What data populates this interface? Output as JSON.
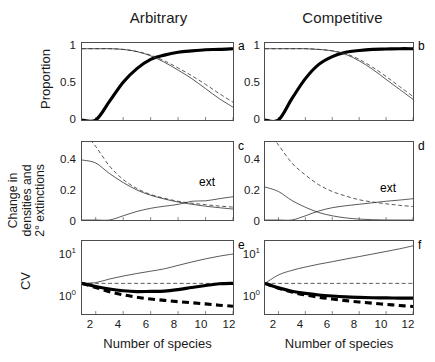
{
  "figure": {
    "column_titles": [
      "Arbitrary",
      "Competitive"
    ],
    "xlabel": "Number of species",
    "ylabels": {
      "row1": "Proportion",
      "row2_line1": "Change in",
      "row2_line2": "densities and",
      "row2_line3": "2° extinctions",
      "row3": "CV"
    },
    "xticks": [
      "2",
      "4",
      "6",
      "8",
      "10",
      "12"
    ],
    "yticks_row1": [
      "1",
      "0.5",
      "0"
    ],
    "yticks_row2": [
      "0.4",
      "0.2",
      "0"
    ],
    "yticks_row3": [
      "10",
      "10"
    ],
    "yticks_row3_exp": [
      "1",
      "0"
    ],
    "panel_letters": [
      "a",
      "b",
      "c",
      "d",
      "e",
      "f"
    ],
    "annotation_ext": "ext"
  },
  "chart_data": [
    {
      "type": "line",
      "panel": "a",
      "title": "Arbitrary",
      "xlabel": "Number of species",
      "ylabel": "Proportion",
      "xlim": [
        1,
        12
      ],
      "ylim": [
        0,
        1.08
      ],
      "x": [
        1,
        2,
        3,
        4,
        5,
        6,
        7,
        8,
        9,
        10,
        11,
        12
      ],
      "series": [
        {
          "name": "proportion-thick-solid",
          "style": "thick-solid",
          "values": [
            0.0,
            0.0,
            0.26,
            0.53,
            0.72,
            0.85,
            0.91,
            0.95,
            0.97,
            0.985,
            0.99,
            1.0
          ]
        },
        {
          "name": "proportion-thin-solid",
          "style": "thin-solid",
          "values": [
            1.0,
            1.0,
            1.0,
            0.99,
            0.96,
            0.9,
            0.81,
            0.7,
            0.58,
            0.44,
            0.3,
            0.18
          ]
        },
        {
          "name": "proportion-thin-dashed",
          "style": "thin-dashed",
          "values": [
            1.0,
            1.0,
            1.0,
            0.99,
            0.96,
            0.91,
            0.83,
            0.73,
            0.62,
            0.5,
            0.37,
            0.25
          ]
        }
      ]
    },
    {
      "type": "line",
      "panel": "b",
      "title": "Competitive",
      "xlabel": "Number of species",
      "ylabel": "Proportion",
      "xlim": [
        1,
        12
      ],
      "ylim": [
        0,
        1.08
      ],
      "x": [
        1,
        2,
        3,
        4,
        5,
        6,
        7,
        8,
        9,
        10,
        11,
        12
      ],
      "series": [
        {
          "name": "proportion-thick-solid",
          "style": "thick-solid",
          "values": [
            0.0,
            0.0,
            0.3,
            0.58,
            0.78,
            0.89,
            0.95,
            0.975,
            0.99,
            0.995,
            1.0,
            1.0
          ]
        },
        {
          "name": "proportion-thin-solid",
          "style": "thin-solid",
          "values": [
            1.0,
            1.0,
            1.0,
            1.0,
            0.99,
            0.97,
            0.92,
            0.83,
            0.71,
            0.57,
            0.43,
            0.29
          ]
        },
        {
          "name": "proportion-thin-dashed",
          "style": "thin-dashed",
          "values": [
            1.0,
            1.0,
            1.0,
            1.0,
            0.99,
            0.97,
            0.93,
            0.85,
            0.74,
            0.61,
            0.47,
            0.33
          ]
        }
      ]
    },
    {
      "type": "line",
      "panel": "c",
      "title": "Arbitrary",
      "xlabel": "Number of species",
      "ylabel": "Change in densities and 2° extinctions",
      "xlim": [
        1,
        12
      ],
      "ylim": [
        0,
        0.52
      ],
      "x": [
        1,
        2,
        3,
        4,
        5,
        6,
        7,
        8,
        9,
        10,
        11,
        12
      ],
      "series": [
        {
          "name": "change-thin-dashed",
          "style": "thin-dashed",
          "values": [
            0.6,
            0.49,
            0.36,
            0.27,
            0.21,
            0.17,
            0.145,
            0.125,
            0.112,
            0.102,
            0.093,
            0.086
          ]
        },
        {
          "name": "change-thin-solid-decay",
          "style": "thin-solid",
          "values": [
            0.4,
            0.38,
            0.31,
            0.25,
            0.2,
            0.165,
            0.14,
            0.12,
            0.105,
            0.092,
            0.082,
            0.073
          ]
        },
        {
          "name": "extinctions-thin-solid-rise",
          "style": "thin-solid",
          "values": [
            0.0,
            0.0,
            0.0,
            0.028,
            0.057,
            0.078,
            0.092,
            0.104,
            0.125,
            0.128,
            0.142,
            0.155
          ]
        }
      ],
      "annotations": [
        {
          "text": "ext",
          "x": 10.3,
          "y": 0.215
        }
      ]
    },
    {
      "type": "line",
      "panel": "d",
      "title": "Competitive",
      "xlabel": "Number of species",
      "ylabel": "Change in densities and 2° extinctions",
      "xlim": [
        1,
        12
      ],
      "ylim": [
        0,
        0.52
      ],
      "x": [
        1,
        2,
        3,
        4,
        5,
        6,
        7,
        8,
        9,
        10,
        11,
        12
      ],
      "series": [
        {
          "name": "change-thin-dashed",
          "style": "thin-dashed",
          "values": [
            0.62,
            0.5,
            0.38,
            0.3,
            0.235,
            0.19,
            0.16,
            0.135,
            0.12,
            0.108,
            0.098,
            0.09
          ]
        },
        {
          "name": "change-thin-solid-decay",
          "style": "thin-solid",
          "values": [
            0.22,
            0.19,
            0.13,
            0.085,
            0.05,
            0.028,
            0.014,
            0.006,
            0.002,
            0.0,
            0.0,
            0.0
          ]
        },
        {
          "name": "extinctions-thin-solid-rise",
          "style": "thin-solid",
          "values": [
            0.0,
            0.0,
            0.0,
            0.028,
            0.06,
            0.082,
            0.095,
            0.105,
            0.115,
            0.125,
            0.133,
            0.142
          ]
        }
      ],
      "annotations": [
        {
          "text": "ext",
          "x": 10.3,
          "y": 0.205
        }
      ]
    },
    {
      "type": "line",
      "panel": "e",
      "title": "Arbitrary",
      "xlabel": "Number of species",
      "ylabel": "CV",
      "yscale": "log",
      "xlim": [
        1,
        12
      ],
      "ylim": [
        0.45,
        22
      ],
      "x": [
        1,
        2,
        3,
        4,
        5,
        6,
        7,
        8,
        9,
        10,
        11,
        12
      ],
      "series": [
        {
          "name": "cv-thin-solid-rising",
          "style": "thin-solid",
          "values": [
            2.3,
            2.4,
            2.9,
            3.4,
            3.9,
            4.4,
            5.0,
            6.0,
            7.2,
            8.5,
            9.8,
            11.0
          ]
        },
        {
          "name": "cv-thin-dashed-flat",
          "style": "thin-dashed",
          "values": [
            2.3,
            2.3,
            2.3,
            2.3,
            2.3,
            2.3,
            2.3,
            2.3,
            2.3,
            2.3,
            2.3,
            2.3
          ]
        },
        {
          "name": "cv-thick-solid",
          "style": "thick-solid",
          "values": [
            2.3,
            1.95,
            1.7,
            1.55,
            1.48,
            1.5,
            1.52,
            1.65,
            1.85,
            2.05,
            2.25,
            2.3
          ]
        },
        {
          "name": "cv-thick-dashed",
          "style": "thick-dashed",
          "values": [
            2.3,
            1.85,
            1.48,
            1.25,
            1.1,
            1.0,
            0.93,
            0.87,
            0.82,
            0.77,
            0.72,
            0.68
          ]
        }
      ]
    },
    {
      "type": "line",
      "panel": "f",
      "title": "Competitive",
      "xlabel": "Number of species",
      "ylabel": "CV",
      "yscale": "log",
      "xlim": [
        1,
        12
      ],
      "ylim": [
        0.45,
        22
      ],
      "x": [
        1,
        2,
        3,
        4,
        5,
        6,
        7,
        8,
        9,
        10,
        11,
        12
      ],
      "series": [
        {
          "name": "cv-thin-solid-rising",
          "style": "thin-solid",
          "values": [
            2.3,
            3.6,
            4.6,
            5.5,
            6.4,
            7.3,
            8.4,
            9.6,
            11.0,
            12.6,
            14.5,
            17.0
          ]
        },
        {
          "name": "cv-thin-dashed-flat",
          "style": "thin-dashed",
          "values": [
            2.3,
            2.3,
            2.3,
            2.3,
            2.3,
            2.3,
            2.3,
            2.3,
            2.3,
            2.3,
            2.3,
            2.3
          ]
        },
        {
          "name": "cv-thick-solid",
          "style": "thick-solid",
          "values": [
            2.3,
            1.82,
            1.52,
            1.35,
            1.24,
            1.17,
            1.12,
            1.09,
            1.07,
            1.06,
            1.05,
            1.05
          ]
        },
        {
          "name": "cv-thick-dashed",
          "style": "thick-dashed",
          "values": [
            2.3,
            1.78,
            1.45,
            1.24,
            1.1,
            1.0,
            0.92,
            0.85,
            0.8,
            0.75,
            0.71,
            0.67
          ]
        }
      ]
    }
  ]
}
